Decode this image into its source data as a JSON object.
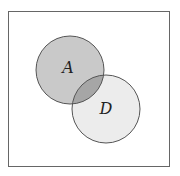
{
  "diagram": {
    "type": "venn",
    "universe": {
      "x": 8,
      "y": 11,
      "width": 162,
      "height": 156,
      "stroke": "#666666"
    },
    "sets": [
      {
        "label": "A",
        "cx": 70,
        "cy": 70,
        "r": 34,
        "fill": "#c9c9c9",
        "stroke": "#555555"
      },
      {
        "label": "D",
        "cx": 106,
        "cy": 109,
        "r": 34,
        "fill": "#ececec",
        "stroke": "#555555"
      }
    ],
    "intersection_fill": "#a6a6a6"
  }
}
